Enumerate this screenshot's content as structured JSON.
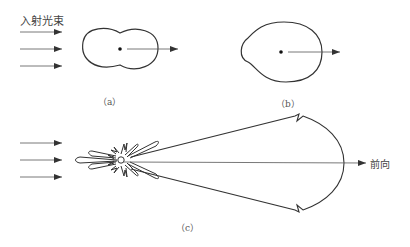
{
  "diagram": {
    "title_label": "入射光束",
    "forward_label": "前向",
    "panels": [
      {
        "id": "a",
        "caption": "（a）"
      },
      {
        "id": "b",
        "caption": "（b）"
      },
      {
        "id": "c",
        "caption": "（c）"
      }
    ],
    "colors": {
      "stroke": "#333333",
      "background": "#ffffff"
    }
  }
}
